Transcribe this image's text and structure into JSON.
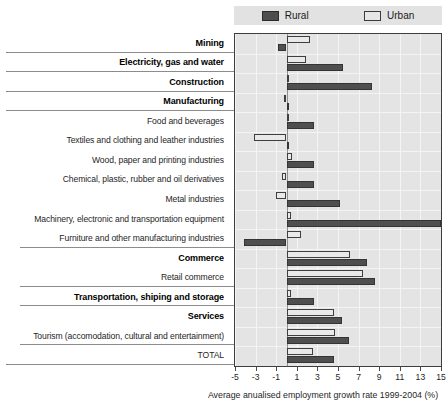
{
  "legend": {
    "entries": [
      {
        "label": "Rural",
        "color": "#4f4f4f",
        "icon": "square-swatch-icon"
      },
      {
        "label": "Urban",
        "color": "#e9e9e9",
        "icon": "square-swatch-icon"
      }
    ]
  },
  "axis": {
    "title": "Average anualised employment growth rate 1999-2004 (%)",
    "ticks": [
      "-5",
      "-3",
      "-1",
      "1",
      "3",
      "5",
      "7",
      "9",
      "11",
      "13",
      "15"
    ],
    "min": -5,
    "max": 15
  },
  "chart_data": {
    "type": "bar",
    "orientation": "horizontal",
    "title": "",
    "xlabel": "Average anualised employment growth rate 1999-2004 (%)",
    "ylabel": "",
    "xlim": [
      -5,
      15
    ],
    "grid": true,
    "legend_position": "top",
    "categories": [
      "Mining",
      "Electricity, gas and water",
      "Construction",
      "Manufacturing",
      "Food and beverages",
      "Textiles and clothing and leather industries",
      "Wood, paper and printing industries",
      "Chemical, plastic, rubber and oil derivatives",
      "Metal industries",
      "Machinery, electronic and transportation equipment",
      "Furniture and other manufacturing industries",
      "Commerce",
      "Retail commerce",
      "Transportation, shiping and storage",
      "Services",
      "Tourism (accomodation, cultural and entertainment)",
      "TOTAL"
    ],
    "category_styles": [
      "bold",
      "bold",
      "bold",
      "bold",
      "normal",
      "normal",
      "normal",
      "normal",
      "normal",
      "normal",
      "normal",
      "bold",
      "normal",
      "bold",
      "bold",
      "normal",
      "normal"
    ],
    "series": [
      {
        "name": "Rural",
        "values": [
          -0.8,
          5.5,
          8.3,
          0.2,
          2.7,
          0.1,
          2.7,
          2.7,
          5.2,
          15.0,
          -4.1,
          7.8,
          8.6,
          2.7,
          5.4,
          6.1,
          4.6
        ]
      },
      {
        "name": "Urban",
        "values": [
          2.3,
          1.9,
          0.0,
          -0.2,
          0.0,
          -3.2,
          0.5,
          -0.4,
          -1.0,
          0.4,
          1.4,
          6.2,
          7.4,
          0.4,
          4.6,
          4.7,
          2.6
        ]
      }
    ]
  },
  "group_separators": [
    1,
    2,
    3,
    4,
    11,
    13,
    14,
    16,
    17
  ],
  "short_separators": [
    11,
    13,
    14,
    16
  ]
}
